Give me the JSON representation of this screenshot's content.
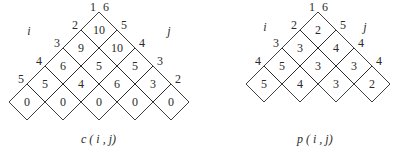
{
  "diagrams": [
    {
      "id": "c",
      "caption": "c ( i , j)",
      "axis_left": "i",
      "axis_right": "j",
      "left_labels": [
        "1",
        "2",
        "3",
        "4",
        "5"
      ],
      "right_labels": [
        "6",
        "5",
        "4",
        "3",
        "2"
      ],
      "rows": [
        [
          "10"
        ],
        [
          "9",
          "10"
        ],
        [
          "6",
          "5",
          "5"
        ],
        [
          "5",
          "4",
          "6",
          "3"
        ],
        [
          "0",
          "0",
          "0",
          "0",
          "0"
        ]
      ]
    },
    {
      "id": "p",
      "caption": "p ( i , j)",
      "axis_left": "i",
      "axis_right": "j",
      "left_labels": [
        "1",
        "2",
        "3",
        "4"
      ],
      "right_labels": [
        "6",
        "5",
        "4",
        "4"
      ],
      "rows": [
        [
          "2"
        ],
        [
          "3",
          "4"
        ],
        [
          "5",
          "3",
          "3"
        ],
        [
          "5",
          "4",
          "3",
          "2"
        ]
      ]
    }
  ]
}
